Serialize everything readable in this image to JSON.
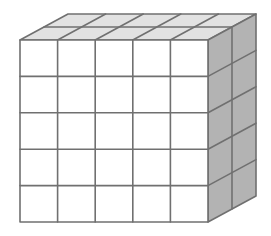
{
  "diagram": {
    "type": "cuboid-of-unit-cubes",
    "front_columns": 5,
    "front_rows": 5,
    "depth_layers": 2,
    "origin": {
      "x": 20,
      "y": 40
    },
    "cell_width": 37.6,
    "cell_height": 36.4,
    "depth_dx": 24,
    "depth_dy": -13,
    "colors": {
      "background": "#ffffff",
      "front_face": "#ffffff",
      "top_face": "#e2e2e2",
      "right_face": "#b3b3b3",
      "line": "#707070"
    },
    "line_width": 1.6
  }
}
